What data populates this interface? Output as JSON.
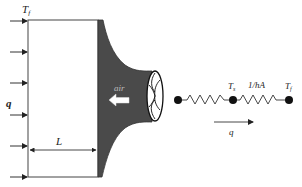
{
  "diagram": {
    "title": "",
    "left_panel": {
      "fluid_temperature_label": "T",
      "fluid_temperature_subscript": "f",
      "heat_flux_label": "q",
      "length_label": "L",
      "air_label": "air",
      "incoming_arrows_count": 6
    },
    "thermal_circuit": {
      "nodes": [
        {
          "id": "left",
          "label": ""
        },
        {
          "id": "surface",
          "label": "T",
          "subscript": "s"
        },
        {
          "id": "fluid",
          "label": "T",
          "subscript": "f"
        }
      ],
      "resistors": [
        {
          "between": [
            "left",
            "surface"
          ],
          "label": ""
        },
        {
          "between": [
            "surface",
            "fluid"
          ],
          "label": "1/hA"
        }
      ],
      "heat_flow_label": "q"
    },
    "colors": {
      "line": "#333333",
      "fin_fill": "#4a4a4a",
      "node": "#111111",
      "background": "#ffffff"
    }
  }
}
